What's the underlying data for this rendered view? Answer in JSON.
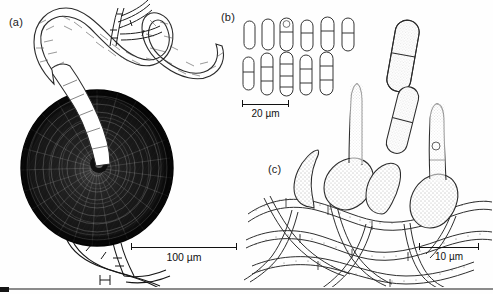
{
  "figure": {
    "kind": "scientific-line-drawing-plate",
    "background_color": "#ffffff",
    "ink_color": "#111111",
    "width": 493,
    "height": 294
  },
  "panels": [
    {
      "id": "a",
      "label": "(a)",
      "description": "dark globose perithecium with pale branched hypha emerging from ostiole and septate hyphae below",
      "scalebar": {
        "length_label": "100 µm",
        "value": 100,
        "unit": "µm"
      }
    },
    {
      "id": "b",
      "label": "(b)",
      "description": "two rows of cylindrical conidia with 0 to 3 transverse septa, plus one enlarged 1-septate conidium at right",
      "scalebar": {
        "length_label": "20 µm",
        "value": 20,
        "unit": "µm"
      }
    },
    {
      "id": "c",
      "label": "(c)",
      "description": "flask-shaped (ampulliform) conidiogenous cells borne on a mat of septate hyphae, each bearing a developing cylindrical conidium",
      "scalebar": {
        "length_label": "10 µm",
        "value": 10,
        "unit": "µm"
      }
    }
  ],
  "scalebars": {
    "panel_a": "100 µm",
    "panel_b": "20 µm",
    "panel_c": "10 µm"
  },
  "conidia": {
    "row1_count": 6,
    "row2_count": 5,
    "enlarged_count": 1,
    "row1_septa": [
      0,
      0,
      1,
      1,
      1,
      1
    ],
    "row2_septa": [
      1,
      2,
      3,
      2,
      2
    ],
    "enlarged_septa": 1
  },
  "conidiogenous_cells": {
    "count": 4,
    "shape": "ampulliform",
    "conidia_attached": 4
  }
}
